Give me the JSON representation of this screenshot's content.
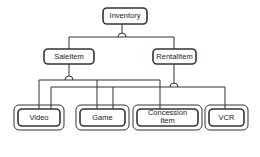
{
  "diagram": {
    "type": "class-hierarchy",
    "root": {
      "label": "Inventory"
    },
    "level1": [
      {
        "label": "SaleItem"
      },
      {
        "label": "RentalItem"
      }
    ],
    "level2": [
      {
        "label": "Video",
        "parents": [
          "SaleItem",
          "RentalItem"
        ]
      },
      {
        "label": "Game",
        "parents": [
          "SaleItem",
          "RentalItem"
        ]
      },
      {
        "label": "Concession Item",
        "parents": [
          "SaleItem"
        ]
      },
      {
        "label": "VCR",
        "parents": [
          "RentalItem"
        ]
      }
    ],
    "colors": {
      "line": "#333333",
      "background": "#ffffff"
    }
  }
}
